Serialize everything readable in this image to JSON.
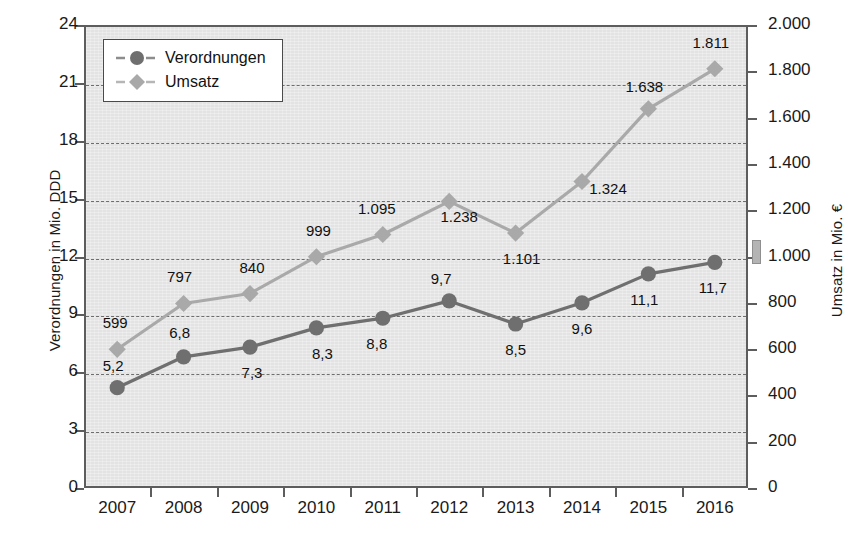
{
  "chart_data": {
    "type": "line",
    "title": "",
    "xlabel": "",
    "categories": [
      "2007",
      "2008",
      "2009",
      "2010",
      "2011",
      "2012",
      "2013",
      "2014",
      "2015",
      "2016"
    ],
    "grid": true,
    "legend_position": "top-left",
    "series": [
      {
        "name": "Verordnungen",
        "axis": "left",
        "unit": "Mio. DDD",
        "color": "#6f6f6f",
        "marker": "circle",
        "values": [
          5.2,
          6.8,
          7.3,
          8.3,
          8.8,
          9.7,
          8.5,
          9.6,
          11.1,
          11.7
        ],
        "labels": [
          "5,2",
          "6,8",
          "7,3",
          "8,3",
          "8,8",
          "9,7",
          "8,5",
          "9,6",
          "11,1",
          "11,7"
        ]
      },
      {
        "name": "Umsatz",
        "axis": "right",
        "unit": "Mio. €",
        "color": "#a9a9a9",
        "marker": "diamond",
        "values": [
          599,
          797,
          840,
          999,
          1095,
          1238,
          1101,
          1324,
          1638,
          1811
        ],
        "labels": [
          "599",
          "797",
          "840",
          "999",
          "1.095",
          "1.238",
          "1.101",
          "1.324",
          "1.638",
          "1.811"
        ]
      }
    ],
    "left_axis": {
      "label": "Verordnungen in Mio. DDD",
      "min": 0,
      "max": 24,
      "step": 3,
      "ticks": [
        "0",
        "3",
        "6",
        "9",
        "12",
        "15",
        "18",
        "21",
        "24"
      ]
    },
    "right_axis": {
      "label": "Umsatz  in Mio. €",
      "min": 0,
      "max": 2000,
      "step": 200,
      "ticks": [
        "0",
        "200",
        "400",
        "600",
        "800",
        "1.000",
        "1.200",
        "1.400",
        "1.600",
        "1.800",
        "2.000"
      ]
    }
  },
  "legend": {
    "items": [
      {
        "label": "Verordnungen",
        "symbol": "circle-marker-icon",
        "color": "#6f6f6f"
      },
      {
        "label": "Umsatz",
        "symbol": "diamond-marker-icon",
        "color": "#a9a9a9"
      }
    ]
  },
  "colors": {
    "plot_background": "#e3e3e3",
    "frame": "#5d5d5d",
    "gridline": "#6e6e6e",
    "verordnungen": "#6f6f6f",
    "umsatz": "#a9a9a9",
    "text": "#1a1a1a"
  }
}
